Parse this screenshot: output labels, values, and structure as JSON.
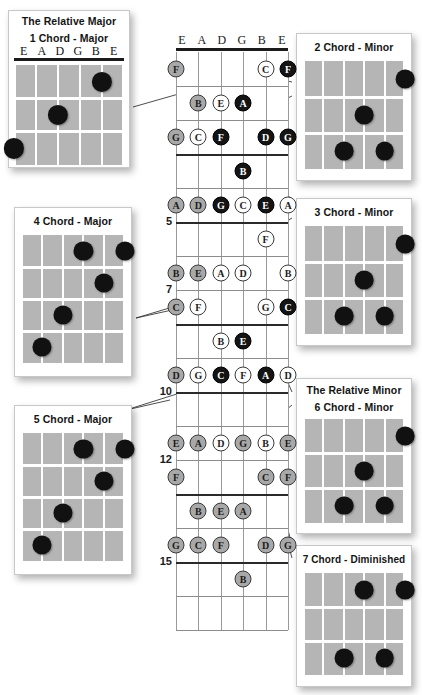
{
  "diagram": {
    "type": "guitar-fretboard-chart",
    "string_labels": [
      "E",
      "A",
      "D",
      "G",
      "B",
      "E"
    ],
    "fret_markers": [
      "5",
      "7",
      "10",
      "12",
      "15"
    ],
    "colors": {
      "fingerboard": "#b5b5b5",
      "dot": "#111111",
      "note_root": "#141414",
      "note_third": "#fdfdfd",
      "note_fifth": "#a8a8a8",
      "nut": "#1b1b1b",
      "page": "#ffffff"
    },
    "legend_note_shades": {
      "black": "root-note",
      "white": "third-note",
      "grey": "fifth-note"
    }
  },
  "fretboard": {
    "frets_shown": 17,
    "markers": [
      {
        "label": "5",
        "fret": 5
      },
      {
        "label": "7",
        "fret": 7
      },
      {
        "label": "10",
        "fret": 10
      },
      {
        "label": "12",
        "fret": 12
      },
      {
        "label": "15",
        "fret": 15
      }
    ],
    "notes": [
      {
        "fret": 1,
        "string": 1,
        "label": "F",
        "shade": "grey"
      },
      {
        "fret": 1,
        "string": 5,
        "label": "C",
        "shade": "white"
      },
      {
        "fret": 1,
        "string": 6,
        "label": "F",
        "shade": "black"
      },
      {
        "fret": 2,
        "string": 2,
        "label": "B",
        "shade": "grey"
      },
      {
        "fret": 2,
        "string": 3,
        "label": "E",
        "shade": "white"
      },
      {
        "fret": 2,
        "string": 4,
        "label": "A",
        "shade": "black"
      },
      {
        "fret": 3,
        "string": 1,
        "label": "G",
        "shade": "grey"
      },
      {
        "fret": 3,
        "string": 2,
        "label": "C",
        "shade": "white"
      },
      {
        "fret": 3,
        "string": 3,
        "label": "F",
        "shade": "black"
      },
      {
        "fret": 3,
        "string": 5,
        "label": "D",
        "shade": "black"
      },
      {
        "fret": 3,
        "string": 6,
        "label": "G",
        "shade": "black"
      },
      {
        "fret": 4,
        "string": 4,
        "label": "B",
        "shade": "black"
      },
      {
        "fret": 5,
        "string": 1,
        "label": "A",
        "shade": "grey"
      },
      {
        "fret": 5,
        "string": 2,
        "label": "D",
        "shade": "grey"
      },
      {
        "fret": 5,
        "string": 3,
        "label": "G",
        "shade": "black"
      },
      {
        "fret": 5,
        "string": 4,
        "label": "C",
        "shade": "white"
      },
      {
        "fret": 5,
        "string": 5,
        "label": "E",
        "shade": "black"
      },
      {
        "fret": 5,
        "string": 6,
        "label": "A",
        "shade": "white"
      },
      {
        "fret": 6,
        "string": 5,
        "label": "F",
        "shade": "white"
      },
      {
        "fret": 7,
        "string": 1,
        "label": "B",
        "shade": "grey"
      },
      {
        "fret": 7,
        "string": 2,
        "label": "E",
        "shade": "grey"
      },
      {
        "fret": 7,
        "string": 3,
        "label": "A",
        "shade": "white"
      },
      {
        "fret": 7,
        "string": 4,
        "label": "D",
        "shade": "white"
      },
      {
        "fret": 7,
        "string": 6,
        "label": "B",
        "shade": "white"
      },
      {
        "fret": 8,
        "string": 1,
        "label": "C",
        "shade": "grey"
      },
      {
        "fret": 8,
        "string": 2,
        "label": "F",
        "shade": "white"
      },
      {
        "fret": 8,
        "string": 5,
        "label": "G",
        "shade": "white"
      },
      {
        "fret": 8,
        "string": 6,
        "label": "C",
        "shade": "black"
      },
      {
        "fret": 9,
        "string": 3,
        "label": "B",
        "shade": "white"
      },
      {
        "fret": 9,
        "string": 4,
        "label": "E",
        "shade": "black"
      },
      {
        "fret": 10,
        "string": 1,
        "label": "D",
        "shade": "grey"
      },
      {
        "fret": 10,
        "string": 2,
        "label": "G",
        "shade": "white"
      },
      {
        "fret": 10,
        "string": 3,
        "label": "C",
        "shade": "black"
      },
      {
        "fret": 10,
        "string": 4,
        "label": "F",
        "shade": "white"
      },
      {
        "fret": 10,
        "string": 5,
        "label": "A",
        "shade": "black"
      },
      {
        "fret": 10,
        "string": 6,
        "label": "D",
        "shade": "white"
      },
      {
        "fret": 12,
        "string": 1,
        "label": "E",
        "shade": "grey"
      },
      {
        "fret": 12,
        "string": 2,
        "label": "A",
        "shade": "grey"
      },
      {
        "fret": 12,
        "string": 3,
        "label": "D",
        "shade": "white"
      },
      {
        "fret": 12,
        "string": 4,
        "label": "G",
        "shade": "grey"
      },
      {
        "fret": 12,
        "string": 5,
        "label": "B",
        "shade": "white"
      },
      {
        "fret": 12,
        "string": 6,
        "label": "E",
        "shade": "grey"
      },
      {
        "fret": 13,
        "string": 1,
        "label": "F",
        "shade": "grey"
      },
      {
        "fret": 13,
        "string": 5,
        "label": "C",
        "shade": "grey"
      },
      {
        "fret": 13,
        "string": 6,
        "label": "F",
        "shade": "grey"
      },
      {
        "fret": 14,
        "string": 2,
        "label": "B",
        "shade": "grey"
      },
      {
        "fret": 14,
        "string": 3,
        "label": "E",
        "shade": "grey"
      },
      {
        "fret": 14,
        "string": 4,
        "label": "A",
        "shade": "grey"
      },
      {
        "fret": 15,
        "string": 1,
        "label": "G",
        "shade": "grey"
      },
      {
        "fret": 15,
        "string": 2,
        "label": "C",
        "shade": "grey"
      },
      {
        "fret": 15,
        "string": 3,
        "label": "F",
        "shade": "grey"
      },
      {
        "fret": 15,
        "string": 5,
        "label": "D",
        "shade": "grey"
      },
      {
        "fret": 15,
        "string": 6,
        "label": "G",
        "shade": "grey"
      },
      {
        "fret": 16,
        "string": 4,
        "label": "B",
        "shade": "grey"
      }
    ]
  },
  "chords": {
    "one": {
      "heading": "The Relative Major",
      "title": "1 Chord - Major",
      "strings": [
        "E",
        "A",
        "D",
        "G",
        "B",
        "E"
      ],
      "show_strings": true,
      "frets": 3,
      "dots": [
        {
          "string": 5,
          "fret": 1
        },
        {
          "string": 3,
          "fret": 2
        },
        {
          "string": 1,
          "fret": 3
        }
      ]
    },
    "two": {
      "heading": "",
      "title": "2 Chord - Minor",
      "show_strings": false,
      "frets": 3,
      "dots": [
        {
          "string": 6,
          "fret": 1
        },
        {
          "string": 4,
          "fret": 2
        },
        {
          "string": 3,
          "fret": 3
        },
        {
          "string": 5,
          "fret": 3
        }
      ]
    },
    "three": {
      "heading": "",
      "title": "3 Chord - Minor",
      "show_strings": false,
      "frets": 3,
      "dots": [
        {
          "string": 6,
          "fret": 1
        },
        {
          "string": 4,
          "fret": 2
        },
        {
          "string": 3,
          "fret": 3
        },
        {
          "string": 5,
          "fret": 3
        }
      ]
    },
    "four": {
      "heading": "",
      "title": "4 Chord - Major",
      "show_strings": false,
      "frets": 4,
      "dots": [
        {
          "string": 4,
          "fret": 1
        },
        {
          "string": 6,
          "fret": 1
        },
        {
          "string": 5,
          "fret": 2
        },
        {
          "string": 3,
          "fret": 3
        },
        {
          "string": 2,
          "fret": 4
        }
      ]
    },
    "five": {
      "heading": "",
      "title": "5 Chord - Major",
      "show_strings": false,
      "frets": 4,
      "dots": [
        {
          "string": 4,
          "fret": 1
        },
        {
          "string": 6,
          "fret": 1
        },
        {
          "string": 5,
          "fret": 2
        },
        {
          "string": 3,
          "fret": 3
        },
        {
          "string": 2,
          "fret": 4
        }
      ]
    },
    "six": {
      "heading": "The Relative Minor",
      "title": "6 Chord - Minor",
      "show_strings": false,
      "frets": 3,
      "dots": [
        {
          "string": 6,
          "fret": 1
        },
        {
          "string": 4,
          "fret": 2
        },
        {
          "string": 3,
          "fret": 3
        },
        {
          "string": 5,
          "fret": 3
        }
      ]
    },
    "seven": {
      "heading": "",
      "title": "7 Chord - Diminished",
      "show_strings": false,
      "frets": 3,
      "dots": [
        {
          "string": 4,
          "fret": 1
        },
        {
          "string": 6,
          "fret": 1
        },
        {
          "string": 3,
          "fret": 3
        },
        {
          "string": 5,
          "fret": 3
        }
      ]
    }
  }
}
